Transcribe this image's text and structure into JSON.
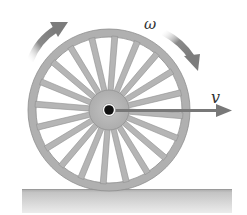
{
  "figure": {
    "labels": {
      "angular_velocity": "ω",
      "linear_velocity": "v"
    },
    "wheel": {
      "center": [
        109,
        110
      ],
      "outer_radius": 81,
      "rim_thickness": 8,
      "hub_radius": 20,
      "axle_radius": 5,
      "spoke_count": 20
    },
    "colors": {
      "wheel_fill": "#b3b3b3",
      "wheel_stroke": "#8c8c8c",
      "axle": "#111111",
      "arrow": "#7a7a7a",
      "ground_top": "#a6a6a6",
      "ground_bottom": "#e6e6e6",
      "label": "#333333"
    }
  }
}
